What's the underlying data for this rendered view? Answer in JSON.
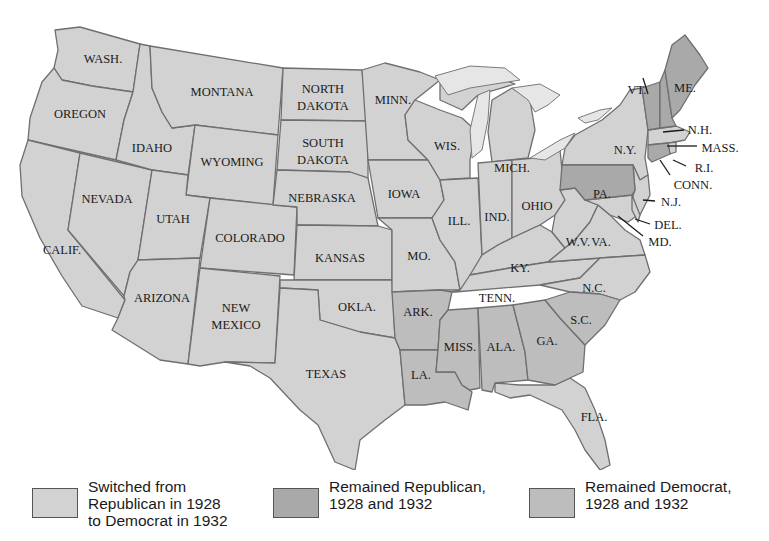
{
  "colors": {
    "switched": "#d2d2d2",
    "remained_republican": "#a9a9a9",
    "remained_democrat": "#bdbdbd",
    "border": "#6f6f6f",
    "lake": "#e6e6e6"
  },
  "legend": [
    {
      "key": "switched",
      "label": "Switched from\nRepublican in 1928\nto Democrat in 1932"
    },
    {
      "key": "remained_republican",
      "label": "Remained Republican,\n1928 and 1932"
    },
    {
      "key": "remained_democrat",
      "label": "Remained Democrat,\n1928 and 1932"
    }
  ],
  "states": {
    "wash": "WASH.",
    "oregon": "OREGON",
    "calif": "CALIF.",
    "idaho": "IDAHO",
    "nevada": "NEVADA",
    "montana": "MONTANA",
    "wyoming": "WYOMING",
    "utah": "UTAH",
    "arizona": "ARIZONA",
    "colorado": "COLORADO",
    "new_mexico_1": "NEW",
    "new_mexico_2": "MEXICO",
    "north_dakota_1": "NORTH",
    "north_dakota_2": "DAKOTA",
    "south_dakota_1": "SOUTH",
    "south_dakota_2": "DAKOTA",
    "nebraska": "NEBRASKA",
    "kansas": "KANSAS",
    "okla": "OKLA.",
    "texas": "TEXAS",
    "minn": "MINN.",
    "iowa": "IOWA",
    "mo": "MO.",
    "ark": "ARK.",
    "la": "LA.",
    "wis": "WIS.",
    "ill": "ILL.",
    "mich": "MICH.",
    "ind": "IND.",
    "ohio": "OHIO",
    "ky": "KY.",
    "tenn": "TENN.",
    "miss": "MISS.",
    "ala": "ALA.",
    "ga": "GA.",
    "fla": "FLA.",
    "sc": "S.C.",
    "nc": "N.C.",
    "va": "VA.",
    "wv": "W.V.",
    "pa": "PA.",
    "ny": "N.Y.",
    "vt": "VT.",
    "me": "ME.",
    "nh": "N.H.",
    "mass": "MASS.",
    "ri": "R.I.",
    "conn": "CONN.",
    "nj": "N.J.",
    "del": "DEL.",
    "md": "MD."
  }
}
